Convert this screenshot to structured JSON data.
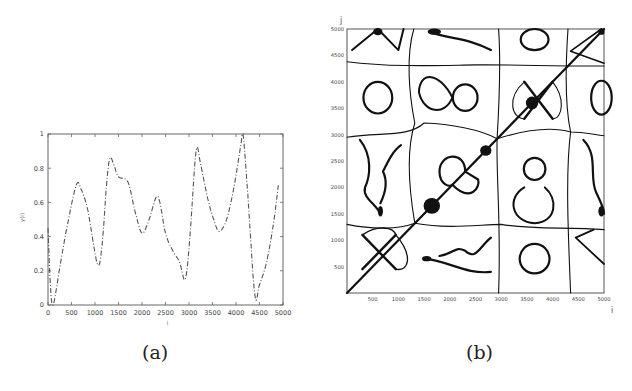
{
  "figure": {
    "captions": [
      "(a)",
      "(b)"
    ]
  },
  "chart_data": [
    {
      "type": "line",
      "panel": "(a)",
      "title": "",
      "xlabel": "i",
      "ylabel": "y(i)",
      "xlim": [
        0,
        5000
      ],
      "ylim": [
        0,
        1
      ],
      "xticks": [
        0,
        500,
        1000,
        1500,
        2000,
        2500,
        3000,
        3500,
        4000,
        4500,
        5000
      ],
      "yticks": [
        0,
        0.2,
        0.4,
        0.6,
        0.8,
        1
      ],
      "ytick_labels": [
        "0",
        "0.2",
        "0.4",
        "0.6",
        "0.8",
        "1"
      ],
      "grid": false,
      "line_style": "dashed",
      "x": [
        0,
        50,
        110,
        250,
        400,
        600,
        700,
        850,
        1050,
        1150,
        1250,
        1320,
        1400,
        1500,
        1700,
        1850,
        2000,
        2150,
        2300,
        2380,
        2500,
        2650,
        2800,
        2920,
        3020,
        3150,
        3250,
        3400,
        3550,
        3650,
        3800,
        3950,
        4100,
        4150,
        4250,
        4400,
        4500,
        4650,
        4800,
        4900
      ],
      "y": [
        0.45,
        0.12,
        0.0,
        0.22,
        0.45,
        0.7,
        0.68,
        0.55,
        0.24,
        0.35,
        0.72,
        0.86,
        0.82,
        0.75,
        0.72,
        0.55,
        0.42,
        0.5,
        0.63,
        0.6,
        0.42,
        0.32,
        0.25,
        0.15,
        0.4,
        0.9,
        0.82,
        0.62,
        0.48,
        0.43,
        0.5,
        0.68,
        0.93,
        1.0,
        0.65,
        0.06,
        0.12,
        0.25,
        0.48,
        0.7
      ]
    },
    {
      "type": "heatmap",
      "panel": "(b)",
      "title": "",
      "xlabel": "i",
      "ylabel": "j",
      "xlim": [
        0,
        5000
      ],
      "ylim": [
        0,
        5000
      ],
      "xticks": [
        500,
        1000,
        1500,
        2000,
        2500,
        3000,
        3500,
        4000,
        4500,
        5000
      ],
      "yticks": [
        500,
        1000,
        1500,
        2000,
        2500,
        3000,
        3500,
        4000,
        4500,
        5000
      ],
      "description": "Recurrence plot (symmetric contour pattern) of y(i), with main diagonal and closed loops",
      "grid": false
    }
  ]
}
